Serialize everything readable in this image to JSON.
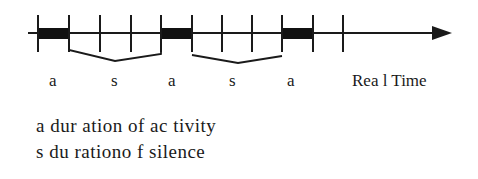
{
  "diagram": {
    "axis_label": "Rea l Time",
    "segment_labels": [
      "a",
      "s",
      "a",
      "s",
      "a"
    ],
    "legend": [
      "a dur ation of ac tivity",
      "s du rationo f silence"
    ],
    "tick_x": [
      38,
      69,
      100,
      131,
      161,
      192,
      222,
      252,
      282,
      313,
      343
    ],
    "active_blocks": [
      [
        38,
        69
      ],
      [
        161,
        192
      ],
      [
        282,
        313
      ]
    ],
    "silence_brackets": [
      [
        69,
        161
      ],
      [
        192,
        282
      ]
    ],
    "colors": {
      "line": "#1a1a1a",
      "block": "#111111",
      "background": "#ffffff"
    }
  }
}
